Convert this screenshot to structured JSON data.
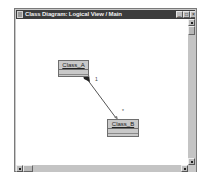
{
  "window": {
    "title": "Class Diagram: Logical View / Main",
    "buttons": {
      "minimize": "_",
      "maximize": "□",
      "close": "×"
    }
  },
  "diagram": {
    "classes": [
      {
        "name": "Class_A"
      },
      {
        "name": "Class_B"
      }
    ],
    "association": {
      "type": "aggregation",
      "from": "Class_A",
      "to": "Class_B",
      "multiplicity_from": "1",
      "multiplicity_to": "*"
    }
  },
  "colors": {
    "titlebar": "#3c3c3c",
    "class_fill": "#c9c9c9",
    "canvas": "#ffffff",
    "frame": "#c8c8c8"
  }
}
